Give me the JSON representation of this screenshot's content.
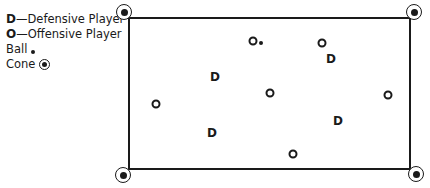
{
  "legend": {
    "defensive": {
      "symbol": "D",
      "label": "—Defensive Player"
    },
    "offensive": {
      "symbol": "O",
      "label": "—Offensive Player"
    },
    "ball": {
      "label": "Ball"
    },
    "cone": {
      "label": "Cone"
    }
  },
  "field": {
    "left": 128,
    "top": 17,
    "right": 411,
    "bottom": 170
  },
  "cones": [
    {
      "x": 124,
      "y": 12
    },
    {
      "x": 414,
      "y": 12
    },
    {
      "x": 123,
      "y": 175
    },
    {
      "x": 416,
      "y": 174
    }
  ],
  "players": [
    {
      "type": "O",
      "x": 253,
      "y": 41
    },
    {
      "type": "O",
      "x": 322,
      "y": 43
    },
    {
      "type": "D",
      "x": 331,
      "y": 59
    },
    {
      "type": "D",
      "x": 215,
      "y": 77
    },
    {
      "type": "O",
      "x": 270,
      "y": 93
    },
    {
      "type": "O",
      "x": 388,
      "y": 95
    },
    {
      "type": "O",
      "x": 156,
      "y": 104
    },
    {
      "type": "D",
      "x": 338,
      "y": 121
    },
    {
      "type": "D",
      "x": 212,
      "y": 133
    },
    {
      "type": "O",
      "x": 293,
      "y": 154
    }
  ],
  "ball": {
    "x": 261,
    "y": 43
  }
}
